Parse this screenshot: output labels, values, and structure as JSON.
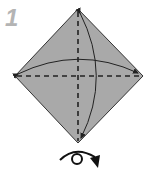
{
  "diagram": {
    "type": "origami-step",
    "step_number": "1",
    "paper": {
      "shape": "diamond",
      "fill": "#a9a9a9",
      "stroke": "#333333"
    },
    "folds": [
      {
        "name": "vertical-valley-fold",
        "style": "dashed"
      },
      {
        "name": "horizontal-valley-fold",
        "style": "dashed"
      }
    ],
    "arrows": [
      {
        "name": "fold-top-to-bottom-arrow",
        "type": "curved"
      },
      {
        "name": "fold-left-to-right-arrow",
        "type": "curved"
      }
    ],
    "symbol": "turn-over"
  }
}
